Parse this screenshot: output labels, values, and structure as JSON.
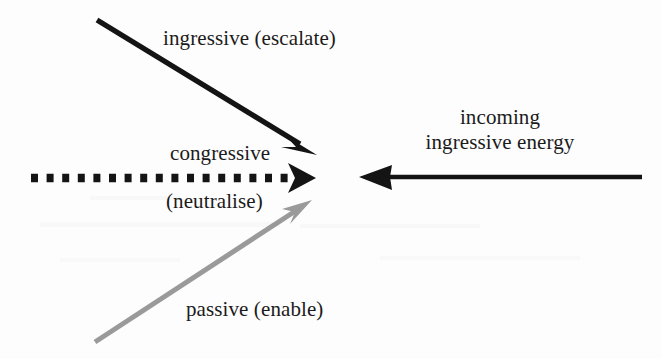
{
  "figure": {
    "background_color": "#fdfdfd",
    "ink_color": "#141414",
    "gray_color": "#9a9a9a",
    "width": 662,
    "height": 359
  },
  "labels": {
    "ingressive_escalate": "ingressive (escalate)",
    "incoming_line1": "incoming",
    "incoming_line2": "ingressive energy",
    "congressive": "congressive",
    "neutralise": "(neutralise)",
    "passive_enable": "passive (enable)"
  },
  "arrows": [
    {
      "name": "ingressive-arrow",
      "label": "ingressive (escalate)",
      "style": "solid",
      "color": "#141414",
      "thickness": 5,
      "from": [
        97,
        20
      ],
      "to": [
        316,
        154
      ],
      "direction": "down-right"
    },
    {
      "name": "congressive-arrow",
      "label": "congressive (neutralise)",
      "style": "square-dashed",
      "color": "#141414",
      "thickness": 8,
      "dash": 7,
      "gap": 8.5,
      "from": [
        28,
        178
      ],
      "to": [
        315,
        178
      ],
      "direction": "right"
    },
    {
      "name": "passive-arrow",
      "label": "passive (enable)",
      "style": "solid",
      "color": "#9a9a9a",
      "thickness": 5,
      "from": [
        95,
        342
      ],
      "to": [
        311,
        201
      ],
      "direction": "up-right"
    },
    {
      "name": "incoming-energy-arrow",
      "label": "incoming ingressive energy",
      "style": "solid",
      "color": "#141414",
      "thickness": 4,
      "from": [
        642,
        177
      ],
      "to": [
        360,
        177
      ],
      "direction": "left"
    }
  ],
  "convergence_point": [
    318,
    178
  ]
}
